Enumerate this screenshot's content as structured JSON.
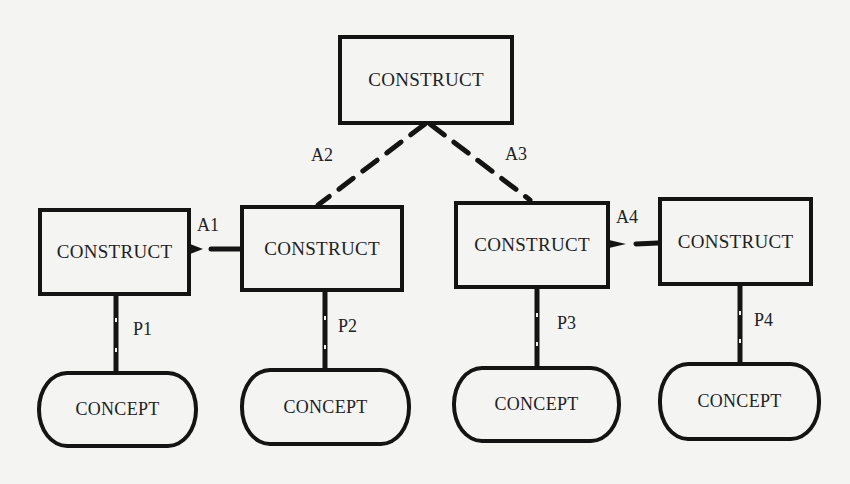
{
  "diagram": {
    "type": "construct-concept hierarchy",
    "top_construct": {
      "label": "CONSTRUCT"
    },
    "constructs": [
      {
        "id": "c1",
        "label": "CONSTRUCT"
      },
      {
        "id": "c2",
        "label": "CONSTRUCT"
      },
      {
        "id": "c3",
        "label": "CONSTRUCT"
      },
      {
        "id": "c4",
        "label": "CONSTRUCT"
      }
    ],
    "concepts": [
      {
        "id": "k1",
        "label": "CONCEPT"
      },
      {
        "id": "k2",
        "label": "CONCEPT"
      },
      {
        "id": "k3",
        "label": "CONCEPT"
      },
      {
        "id": "k4",
        "label": "CONCEPT"
      }
    ],
    "associations": [
      {
        "label": "A1",
        "from": "c1",
        "to": "c2",
        "style": "short-dashed"
      },
      {
        "label": "A2",
        "from": "top",
        "to": "c2",
        "style": "dashed"
      },
      {
        "label": "A3",
        "from": "top",
        "to": "c3",
        "style": "dashed"
      },
      {
        "label": "A4",
        "from": "c3",
        "to": "c4",
        "style": "short-dashed"
      }
    ],
    "postulates": [
      {
        "label": "P1",
        "from": "c1",
        "to": "k1",
        "style": "beaded-line"
      },
      {
        "label": "P2",
        "from": "c2",
        "to": "k2",
        "style": "beaded-line"
      },
      {
        "label": "P3",
        "from": "c3",
        "to": "k3",
        "style": "beaded-line"
      },
      {
        "label": "P4",
        "from": "c4",
        "to": "k4",
        "style": "beaded-line"
      }
    ]
  },
  "colors": {
    "ink": "#141414",
    "paper": "#f4f4f2"
  }
}
